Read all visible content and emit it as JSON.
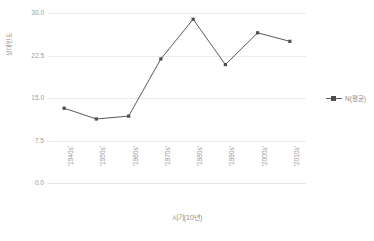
{
  "chart_data": {
    "type": "line",
    "title": "",
    "xlabel": "시기(10년)",
    "ylabel": "상대빈도",
    "categories": [
      "'1940s'",
      "'1950s'",
      "'1960s'",
      "'1970s'",
      "'1980s'",
      "'1990s'",
      "'2000s'",
      "'2010s'"
    ],
    "values": [
      13.2,
      11.3,
      11.8,
      21.9,
      28.9,
      20.9,
      26.5,
      25.0
    ],
    "series": [
      {
        "name": "N(평균)",
        "values": [
          13.2,
          11.3,
          11.8,
          21.9,
          28.9,
          20.9,
          26.5,
          25.0
        ]
      }
    ],
    "ylim": [
      0.0,
      30.0
    ],
    "yticks": [
      0.0,
      7.5,
      15.0,
      22.5,
      30.0
    ],
    "ytick_labels": [
      "0.0",
      "7.5",
      "15.0",
      "22.5",
      "30.0"
    ],
    "grid": true,
    "legend_position": "right",
    "legend_entries": [
      "N(평균)"
    ],
    "marker": "square",
    "line_color": "#595959",
    "marker_color": "#4d4d4d",
    "grid_color": "#ebebeb",
    "text_color": "#8c8c8c"
  },
  "legend": {
    "entry_label": "N(평균)"
  },
  "axes": {
    "y_title": "상대빈도",
    "x_title": "시기(10년)",
    "y_tick_0": "0.0",
    "y_tick_1": "7.5",
    "y_tick_2": "15.0",
    "y_tick_3": "22.5",
    "y_tick_4": "30.0"
  },
  "caption": {
    "text": ""
  }
}
